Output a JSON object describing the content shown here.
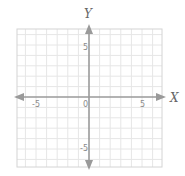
{
  "chart_data": {
    "type": "coordinate-plane",
    "title": "",
    "xlabel": "X",
    "ylabel": "Y",
    "xlim": [
      -7,
      7
    ],
    "ylim": [
      -7,
      7
    ],
    "grid": true,
    "grid_step": 1,
    "axes_arrows": true,
    "x_tick_labels": [
      {
        "value": -5,
        "label": "-5"
      },
      {
        "value": 0,
        "label": "0"
      },
      {
        "value": 5,
        "label": "5"
      }
    ],
    "y_tick_labels": [
      {
        "value": 5,
        "label": "5"
      },
      {
        "value": -5,
        "label": "-5"
      }
    ],
    "series": []
  },
  "labels": {
    "x_axis": "X",
    "y_axis": "Y",
    "origin": "0",
    "x_neg5": "-5",
    "x_pos5": "5",
    "y_pos5": "5",
    "y_neg5": "-5"
  },
  "colors": {
    "grid": "#e6e6e6",
    "border": "#d4d4d4",
    "axis": "#9a9a9a",
    "label": "#8a8a8a"
  }
}
